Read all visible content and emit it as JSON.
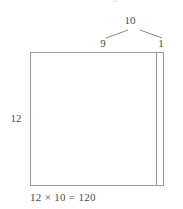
{
  "figure": {
    "type": "area-model-with-number-bond",
    "clipped_glyph_above": "9"
  },
  "number_bond": {
    "total": "10",
    "part_left": "9",
    "part_right": "1",
    "line_color": "#8a8a8a"
  },
  "area_model": {
    "height_label": "12",
    "border_color": "#9a9a9a",
    "divider_color": "#9a9a9a",
    "fill_color": "#ffffff",
    "main_part_label": "9",
    "strip_part_label": "1"
  },
  "equation": {
    "text": "12 × 10 = 120",
    "left_factor": "12",
    "operator": "×",
    "right_factor": "10",
    "equals": "=",
    "product": "120"
  },
  "colors": {
    "text": "#4a4a4a",
    "stroke": "#9a9a9a",
    "faint": "#d8d8d8",
    "background": "#ffffff"
  }
}
